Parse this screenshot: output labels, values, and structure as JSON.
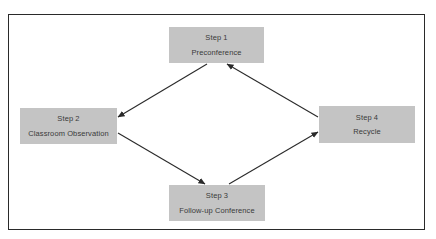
{
  "diagram": {
    "type": "cycle-flow",
    "colors": {
      "box_fill": "#c4c4c4",
      "text": "#3a3a3a",
      "arrow": "#2a2a2a",
      "frame": "#2a2a2a",
      "background": "#ffffff"
    },
    "nodes": [
      {
        "id": "step1",
        "step": "Step 1",
        "label": "Preconference"
      },
      {
        "id": "step2",
        "step": "Step 2",
        "label": "Classroom Observation"
      },
      {
        "id": "step3",
        "step": "Step 3",
        "label": "Follow-up Conference"
      },
      {
        "id": "step4",
        "step": "Step 4",
        "label": "Recycle"
      }
    ],
    "edges": [
      {
        "from": "step1",
        "to": "step2"
      },
      {
        "from": "step2",
        "to": "step3"
      },
      {
        "from": "step3",
        "to": "step4"
      },
      {
        "from": "step4",
        "to": "step1"
      }
    ]
  }
}
